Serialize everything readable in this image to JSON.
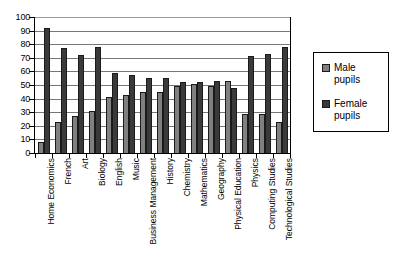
{
  "chart_data": {
    "type": "bar",
    "title": "",
    "subtitle": "",
    "xlabel": "",
    "ylabel": "",
    "ylim": [
      0,
      100
    ],
    "y_ticks": [
      0,
      10,
      20,
      30,
      40,
      50,
      60,
      70,
      80,
      90,
      100
    ],
    "grid": true,
    "grid_axis": "y",
    "legend_position": "right",
    "categories": [
      "Home Economics",
      "French",
      "Art",
      "Biology",
      "English",
      "Music",
      "Business Management",
      "History",
      "Chemistry",
      "Mathematics",
      "Geography",
      "Physical Education",
      "Physics",
      "Computing Studies",
      "Technological Studies"
    ],
    "series": [
      {
        "name": "Male pupils",
        "color": "#808080",
        "values": [
          8,
          23,
          27,
          31,
          41,
          43,
          45,
          45,
          49,
          51,
          49,
          53,
          29,
          29,
          23
        ]
      },
      {
        "name": "Female pupils",
        "color": "#3a3a3a",
        "values": [
          92,
          77,
          72,
          78,
          59,
          57,
          55,
          55,
          52,
          52,
          53,
          48,
          71,
          73,
          78
        ]
      }
    ],
    "annotations": []
  },
  "legend": {
    "items": [
      {
        "label_line1": "Male",
        "label_line2": "pupils",
        "swatch": "male"
      },
      {
        "label_line1": "Female",
        "label_line2": "pupils",
        "swatch": "female"
      }
    ]
  }
}
